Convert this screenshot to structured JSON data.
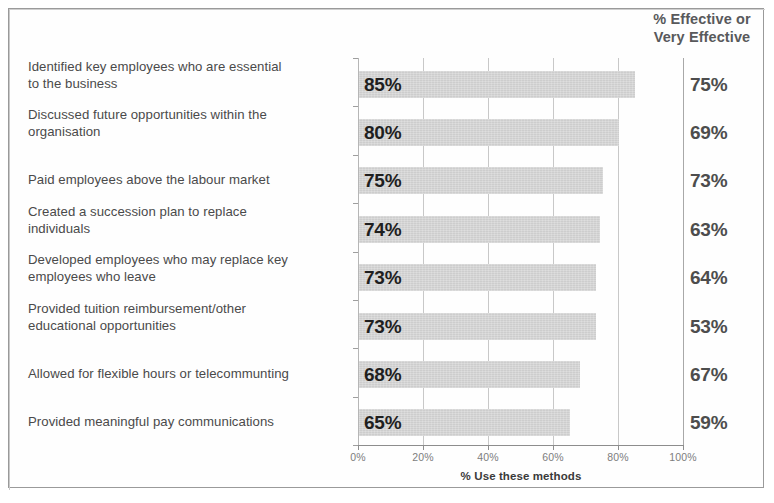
{
  "right_column_header": "% Effective or\nVery Effective",
  "right_column_header_line1": "% Effective or",
  "right_column_header_line2": "Very Effective",
  "xaxis_title": "% Use these methods",
  "chart_data": {
    "type": "bar",
    "orientation": "horizontal",
    "title": "",
    "xlabel": "% Use these methods",
    "ylabel": "",
    "xlim": [
      0,
      100
    ],
    "xticks": [
      "0%",
      "20%",
      "40%",
      "60%",
      "80%",
      "100%"
    ],
    "xtick_values": [
      0,
      20,
      40,
      60,
      80,
      100
    ],
    "grid": true,
    "legend": "none",
    "bar_color": "#d4d4d4",
    "categories": [
      "Identified key employees who are essential to the business",
      "Discussed future opportunities within the organisation",
      "Paid employees above the labour market",
      "Created a succession plan to replace individuals",
      "Developed employees who may replace key employees who leave",
      "Provided tuition reimbursement/other educational opportunities",
      "Allowed for flexible hours or telecommunting",
      "Provided meaningful pay communications"
    ],
    "series": [
      {
        "name": "% Use these methods",
        "values": [
          85,
          80,
          75,
          74,
          73,
          73,
          68,
          65
        ],
        "labels": [
          "85%",
          "80%",
          "75%",
          "74%",
          "73%",
          "73%",
          "68%",
          "65%"
        ]
      },
      {
        "name": "% Effective or Very Effective",
        "values": [
          75,
          69,
          73,
          63,
          64,
          53,
          67,
          59
        ],
        "labels": [
          "75%",
          "69%",
          "73%",
          "63%",
          "64%",
          "53%",
          "67%",
          "59%"
        ]
      }
    ]
  },
  "rows": [
    {
      "label_line1": "Identified key employees who are essential",
      "label_line2": "to the business",
      "use_label": "85%",
      "effective_label": "75%"
    },
    {
      "label_line1": "Discussed future opportunities within the",
      "label_line2": "organisation",
      "use_label": "80%",
      "effective_label": "69%"
    },
    {
      "label_line1": "Paid employees above the labour market",
      "label_line2": "",
      "use_label": "75%",
      "effective_label": "73%"
    },
    {
      "label_line1": "Created a succession plan to replace",
      "label_line2": "individuals",
      "use_label": "74%",
      "effective_label": "63%"
    },
    {
      "label_line1": "Developed employees who may replace key",
      "label_line2": "employees who leave",
      "use_label": "73%",
      "effective_label": "64%"
    },
    {
      "label_line1": "Provided tuition reimbursement/other",
      "label_line2": "educational opportunities",
      "use_label": "73%",
      "effective_label": "53%"
    },
    {
      "label_line1": "Allowed for flexible hours or telecommunting",
      "label_line2": "",
      "use_label": "68%",
      "effective_label": "67%"
    },
    {
      "label_line1": "Provided meaningful pay communications",
      "label_line2": "",
      "use_label": "65%",
      "effective_label": "59%"
    }
  ],
  "xticks": [
    {
      "label": "0%"
    },
    {
      "label": "20%"
    },
    {
      "label": "40%"
    },
    {
      "label": "60%"
    },
    {
      "label": "80%"
    },
    {
      "label": "100%"
    }
  ]
}
